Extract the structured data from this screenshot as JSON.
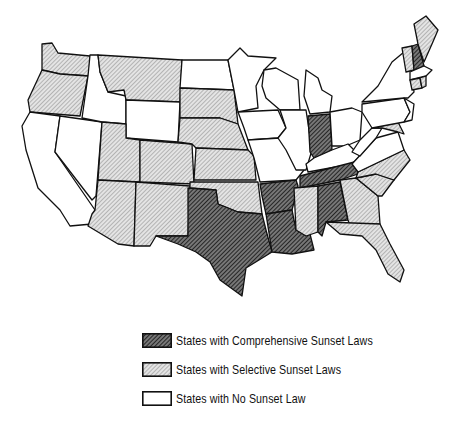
{
  "map": {
    "title": "",
    "categories": {
      "comprehensive": {
        "label": "States with Comprehensive Sunset Laws",
        "fill": "dark-hatch"
      },
      "selective": {
        "label": "States with Selective Sunset Laws",
        "fill": "light-hatch"
      },
      "none": {
        "label": "States with No Sunset Law",
        "fill": "white"
      }
    },
    "states": {
      "comprehensive": [
        "Texas",
        "Arkansas",
        "Louisiana",
        "Tennessee",
        "Alabama",
        "Indiana",
        "New Hampshire"
      ],
      "selective": [
        "Washington",
        "Oregon",
        "Montana",
        "South Dakota",
        "Nebraska",
        "Kansas",
        "Oklahoma",
        "Colorado",
        "Utah",
        "Arizona",
        "New Mexico",
        "Mississippi",
        "Georgia",
        "Florida",
        "South Carolina",
        "North Carolina",
        "Maine",
        "Vermont",
        "Connecticut",
        "Rhode Island",
        "Maryland"
      ],
      "none": [
        "California",
        "Nevada",
        "Idaho",
        "Wyoming",
        "North Dakota",
        "Minnesota",
        "Iowa",
        "Missouri",
        "Wisconsin",
        "Illinois",
        "Michigan",
        "Ohio",
        "Kentucky",
        "West Virginia",
        "Virginia",
        "Pennsylvania",
        "New York",
        "New Jersey",
        "Delaware",
        "Massachusetts"
      ]
    }
  },
  "legend": {
    "items": [
      {
        "key": "comprehensive",
        "label": "States with Comprehensive Sunset Laws"
      },
      {
        "key": "selective",
        "label": "States with Selective Sunset Laws"
      },
      {
        "key": "none",
        "label": "States with No Sunset Law"
      }
    ]
  }
}
